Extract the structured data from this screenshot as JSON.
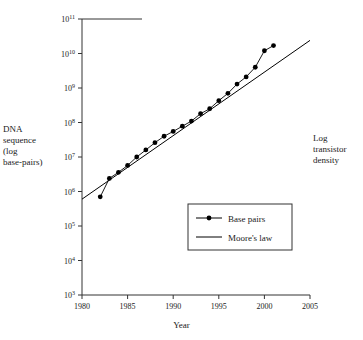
{
  "chart_data": {
    "type": "line",
    "title": "",
    "xlabel": "Year",
    "ylabel_left": "DNA\nsequence\n(log\nbase-pairs)",
    "ylabel_right": "Log\ntransistor\ndensity",
    "xlim": [
      1980,
      2005
    ],
    "ylim": [
      1000,
      100000000000
    ],
    "yscale": "log",
    "grid": false,
    "legend_position": "lower-right-inside",
    "xticks": [
      1980,
      1985,
      1990,
      1995,
      2000,
      2005
    ],
    "xtick_labels": [
      "1980",
      "1985",
      "1990",
      "1995",
      "2000",
      "2005"
    ],
    "yticks": [
      1000,
      10000,
      100000,
      1000000,
      10000000,
      100000000,
      1000000000,
      10000000000,
      100000000000
    ],
    "ytick_labels": [
      "10³",
      "10⁴",
      "10⁵",
      "10⁶",
      "10⁷",
      "10⁸",
      "10⁹",
      "10¹⁰",
      "10¹¹"
    ],
    "ytick_mantissa": [
      "10",
      "10",
      "10",
      "10",
      "10",
      "10",
      "10",
      "10",
      "10"
    ],
    "ytick_exponent": [
      "3",
      "4",
      "5",
      "6",
      "7",
      "8",
      "9",
      "10",
      "11"
    ],
    "series": [
      {
        "name": "Base pairs",
        "marker": "filled-circle",
        "line": "solid",
        "x": [
          1982,
          1983,
          1984,
          1985,
          1986,
          1987,
          1988,
          1989,
          1990,
          1991,
          1992,
          1993,
          1994,
          1995,
          1996,
          1997,
          1998,
          1999,
          2000,
          2001
        ],
        "y": [
          700000,
          2400000,
          3600000,
          5700000,
          10000000.0,
          16000000.0,
          26000000.0,
          40000000.0,
          55000000.0,
          78000000.0,
          110000000.0,
          180000000.0,
          250000000.0,
          430000000.0,
          700000000.0,
          1300000000.0,
          2100000000.0,
          4000000000.0,
          12000000000.0,
          17000000000.0
        ]
      },
      {
        "name": "Moore's law",
        "marker": "none",
        "line": "solid",
        "x": [
          1980,
          2005
        ],
        "y": [
          600000,
          24000000000.0
        ]
      }
    ],
    "legend_entries": [
      {
        "label": "Base pairs",
        "style": "line-with-marker"
      },
      {
        "label": "Moore's law",
        "style": "line"
      }
    ]
  },
  "axis": {
    "x_title": "Year",
    "left_title": "DNA\nsequence\n(log\nbase-pairs)",
    "right_title": "Log\ntransistor\ndensity"
  }
}
